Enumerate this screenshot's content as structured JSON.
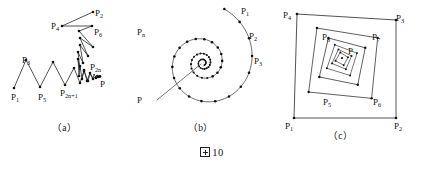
{
  "figure": {
    "caption": "10",
    "caption_prefix_icon": "chinese-figure-box-glyph"
  },
  "panels": [
    {
      "id": "a",
      "sublabel": "（a）",
      "description": "zigzag polyline spiral converging to point P",
      "labels": [
        {
          "name": "P2",
          "base": "P",
          "sub": "2",
          "x": 95,
          "y": 9
        },
        {
          "name": "P4",
          "base": "P",
          "sub": "4",
          "x": 51,
          "y": 22
        },
        {
          "name": "P6",
          "base": "P",
          "sub": "6",
          "x": 94,
          "y": 28
        },
        {
          "name": "P3",
          "base": "P",
          "sub": "3",
          "x": 22,
          "y": 56
        },
        {
          "name": "P2n",
          "base": "P",
          "sub": "2n",
          "x": 90,
          "y": 63
        },
        {
          "name": "P",
          "base": "P",
          "sub": "",
          "x": 100,
          "y": 80
        },
        {
          "name": "P2n1",
          "base": "P",
          "sub": "2n+1",
          "x": 60,
          "y": 89
        },
        {
          "name": "P1",
          "base": "P",
          "sub": "1",
          "x": 11,
          "y": 93
        },
        {
          "name": "P5",
          "base": "P",
          "sub": "5",
          "x": 38,
          "y": 93
        }
      ]
    },
    {
      "id": "b",
      "sublabel": "（b）",
      "description": "archimedean spiral of dotted vertices converging inward",
      "labels": [
        {
          "name": "P1",
          "base": "P",
          "sub": "1",
          "x": 106,
          "y": 7
        },
        {
          "name": "P2",
          "base": "P",
          "sub": "2",
          "x": 114,
          "y": 32
        },
        {
          "name": "P3",
          "base": "P",
          "sub": "3",
          "x": 119,
          "y": 57
        },
        {
          "name": "Pn",
          "base": "P",
          "sub": "n",
          "x": 2,
          "y": 28
        },
        {
          "name": "P",
          "base": "P",
          "sub": "",
          "x": 2,
          "y": 96
        }
      ]
    },
    {
      "id": "c",
      "sublabel": "（c）",
      "description": "nested quadrilaterals spiralling inward to point P",
      "labels": [
        {
          "name": "P4",
          "base": "P",
          "sub": "4",
          "x": 3,
          "y": 11
        },
        {
          "name": "P3",
          "base": "P",
          "sub": "3",
          "x": 116,
          "y": 14
        },
        {
          "name": "P8",
          "base": "P",
          "sub": "8",
          "x": 42,
          "y": 33
        },
        {
          "name": "P7",
          "base": "P",
          "sub": "7",
          "x": 92,
          "y": 33
        },
        {
          "name": "P",
          "base": "P",
          "sub": "",
          "x": 68,
          "y": 47
        },
        {
          "name": "P5",
          "base": "P",
          "sub": "5",
          "x": 43,
          "y": 98
        },
        {
          "name": "P6",
          "base": "P",
          "sub": "6",
          "x": 93,
          "y": 98
        },
        {
          "name": "P1",
          "base": "P",
          "sub": "1",
          "x": 5,
          "y": 122
        },
        {
          "name": "P2",
          "base": "P",
          "sub": "2",
          "x": 114,
          "y": 122
        }
      ]
    }
  ],
  "geometry": {
    "panel_a_polyline": [
      [
        14,
        88
      ],
      [
        26,
        60
      ],
      [
        40,
        87
      ],
      [
        53,
        62
      ],
      [
        65,
        85
      ],
      [
        74,
        68
      ],
      [
        80,
        83
      ],
      [
        84,
        71
      ],
      [
        88,
        81
      ],
      [
        90,
        73
      ],
      [
        93,
        79
      ],
      [
        94,
        74
      ],
      [
        96,
        78
      ],
      [
        97,
        75
      ],
      [
        98,
        77
      ],
      [
        99,
        76
      ],
      [
        99.6,
        76.6
      ],
      [
        100,
        76.2
      ],
      [
        97,
        75
      ],
      [
        93,
        79
      ],
      [
        90,
        73
      ],
      [
        87,
        81
      ],
      [
        84,
        70
      ],
      [
        82,
        79
      ],
      [
        80,
        66
      ],
      [
        79,
        76
      ],
      [
        78,
        59
      ],
      [
        80,
        70
      ],
      [
        78,
        52
      ],
      [
        83,
        63
      ],
      [
        80,
        45
      ],
      [
        88,
        56
      ],
      [
        80,
        38
      ],
      [
        93,
        47
      ],
      [
        79,
        31
      ],
      [
        92,
        26
      ],
      [
        62,
        26
      ],
      [
        93,
        12
      ]
    ],
    "panel_a_nodes": [
      [
        14,
        88
      ],
      [
        26,
        60
      ],
      [
        40,
        87
      ],
      [
        53,
        62
      ],
      [
        65,
        85
      ],
      [
        74,
        68
      ],
      [
        80,
        83
      ],
      [
        84,
        71
      ],
      [
        88,
        81
      ],
      [
        90,
        73
      ],
      [
        93,
        79
      ],
      [
        96,
        78
      ],
      [
        98,
        77
      ],
      [
        99.6,
        76.6
      ],
      [
        100,
        76.2
      ],
      [
        87,
        81
      ],
      [
        84,
        70
      ],
      [
        82,
        79
      ],
      [
        80,
        66
      ],
      [
        79,
        76
      ],
      [
        78,
        59
      ],
      [
        78,
        52
      ],
      [
        80,
        45
      ],
      [
        80,
        38
      ],
      [
        79,
        31
      ],
      [
        92,
        26
      ],
      [
        93,
        47
      ],
      [
        88,
        56
      ],
      [
        83,
        63
      ],
      [
        62,
        26
      ],
      [
        93,
        12
      ]
    ],
    "panel_b": {
      "center": [
        68,
        63
      ],
      "turns": 3.35,
      "points_per_turn": 18,
      "r_start": 58,
      "r_end": 2.5,
      "radial_line_to": [
        22,
        100
      ]
    },
    "panel_c": {
      "outer": [
        [
          14,
          118
        ],
        [
          116,
          118
        ],
        [
          116,
          20
        ],
        [
          17,
          14
        ]
      ],
      "rings": 6,
      "shrink": 0.62
    }
  }
}
